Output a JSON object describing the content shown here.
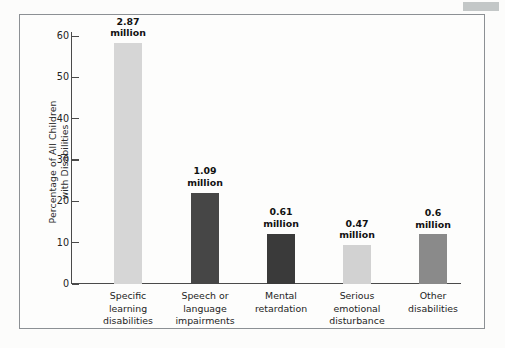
{
  "figure": {
    "frame_border_color": "#8c9094",
    "background_color": "#fdfdfc"
  },
  "chart_data": {
    "type": "bar",
    "title": "",
    "xlabel": "",
    "ylabel": "Percentage of All Children with Disabilities",
    "ylabel_line1": "Percentage of All Children",
    "ylabel_line2": "with Disabilities",
    "ylim": [
      0,
      60
    ],
    "yticks": [
      0,
      10,
      20,
      30,
      40,
      50,
      60
    ],
    "ytick_labels": [
      "0",
      "10",
      "20",
      "30",
      "40",
      "50",
      "60"
    ],
    "grid": false,
    "legend": "none",
    "categories": [
      "Specific learning disabilities",
      "Speech or language impairments",
      "Mental retardation",
      "Serious emotional disturbance",
      "Other disabilities"
    ],
    "category_lines": [
      [
        "Specific",
        "learning",
        "disabilities"
      ],
      [
        "Speech or",
        "language",
        "impairments"
      ],
      [
        "Mental",
        "retardation"
      ],
      [
        "Serious",
        "emotional",
        "disturbance"
      ],
      [
        "Other",
        "disabilities"
      ]
    ],
    "values": [
      57.5,
      21.8,
      12.0,
      9.3,
      11.8
    ],
    "data_labels": [
      {
        "number": "2.87",
        "unit": "million"
      },
      {
        "number": "1.09",
        "unit": "million"
      },
      {
        "number": "0.61",
        "unit": "million"
      },
      {
        "number": "0.47",
        "unit": "million"
      },
      {
        "number": "0.6",
        "unit": "million"
      }
    ],
    "bar_colors": [
      "#d6d6d6",
      "#464646",
      "#3a3a3a",
      "#d2d2d2",
      "#8a8a8a"
    ],
    "axis_color": "#4a4a4a"
  }
}
